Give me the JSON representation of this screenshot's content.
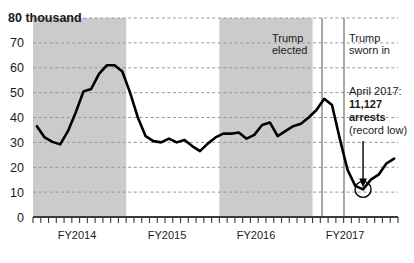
{
  "chart_data": {
    "type": "line",
    "title": "",
    "xlabel": "",
    "ylabel": "",
    "unit_label": "80 thousand",
    "ylim": [
      0,
      80
    ],
    "yticks": [
      0,
      10,
      20,
      30,
      40,
      50,
      60,
      70,
      80
    ],
    "ytick_labels": [
      "0",
      "10",
      "20",
      "30",
      "40",
      "50",
      "60",
      "70",
      "80"
    ],
    "grid": true,
    "legend": "none",
    "categories": [
      "Oct 2013",
      "Nov 2013",
      "Dec 2013",
      "Jan 2014",
      "Feb 2014",
      "Mar 2014",
      "Apr 2014",
      "May 2014",
      "Jun 2014",
      "Jul 2014",
      "Aug 2014",
      "Sep 2014",
      "Oct 2014",
      "Nov 2014",
      "Dec 2014",
      "Jan 2015",
      "Feb 2015",
      "Mar 2015",
      "Apr 2015",
      "May 2015",
      "Jun 2015",
      "Jul 2015",
      "Aug 2015",
      "Sep 2015",
      "Oct 2015",
      "Nov 2015",
      "Dec 2015",
      "Jan 2016",
      "Feb 2016",
      "Mar 2016",
      "Apr 2016",
      "May 2016",
      "Jun 2016",
      "Jul 2016",
      "Aug 2016",
      "Sep 2016",
      "Oct 2016",
      "Nov 2016",
      "Dec 2016",
      "Jan 2017",
      "Feb 2017",
      "Mar 2017",
      "Apr 2017",
      "May 2017",
      "Jun 2017",
      "Jul 2017",
      "Aug 2017"
    ],
    "values": [
      36.5,
      32.0,
      30.2,
      29.2,
      34.5,
      42.0,
      50.5,
      51.5,
      57.5,
      61.0,
      61.0,
      58.5,
      50.0,
      40.0,
      32.5,
      30.5,
      30.0,
      31.5,
      30.0,
      31.0,
      28.5,
      26.5,
      29.5,
      32.0,
      33.5,
      33.5,
      34.0,
      31.5,
      33.0,
      37.0,
      38.0,
      32.5,
      34.5,
      36.5,
      37.5,
      40.0,
      43.0,
      47.5,
      45.0,
      31.5,
      19.0,
      12.5,
      11.1,
      15.0,
      17.0,
      21.5,
      23.5
    ],
    "xtick_labels": [
      "FY2014",
      "FY2015",
      "FY2016",
      "FY2017"
    ],
    "shaded_bands": [
      {
        "start": "FY2014",
        "end": "FY2014"
      },
      {
        "start": "FY2016",
        "end": "FY2016"
      }
    ],
    "line_color": "#000000",
    "band_color": "#cccccc",
    "grid_color": "#9aa3b0",
    "annotations": [
      {
        "name": "trump-elected",
        "label_line1": "Trump",
        "label_line2": "elected",
        "x_value": "Nov 2016"
      },
      {
        "name": "trump-sworn-in",
        "label_line1": "Trump",
        "label_line2": "sworn in",
        "x_value": "Jan 2017"
      },
      {
        "name": "record-low",
        "line1": "April 2017:",
        "line2": "11,127",
        "line3": "arrests",
        "line4": "(record low)",
        "x_value": "Apr 2017",
        "y_value": 11.127
      }
    ]
  },
  "axis": {
    "unit": "80 thousand",
    "y0": "0",
    "y10": "10",
    "y20": "20",
    "y30": "30",
    "y40": "40",
    "y50": "50",
    "y60": "60",
    "y70": "70",
    "x1": "FY2014",
    "x2": "FY2015",
    "x3": "FY2016",
    "x4": "FY2017"
  },
  "annotations": {
    "elected_l1": "Trump",
    "elected_l2": "elected",
    "sworn_l1": "Trump",
    "sworn_l2": "sworn in",
    "record_l1": "April 2017:",
    "record_l2": "11,127",
    "record_l3": "arrests",
    "record_l4": "(record low)"
  }
}
